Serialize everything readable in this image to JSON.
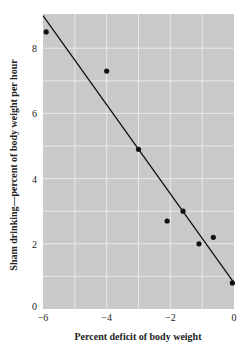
{
  "chart_data": {
    "type": "scatter",
    "title": "",
    "xlabel": "Percent deficit of body weight",
    "ylabel": "Sham drinking—percent of body weight per hour",
    "xlim": [
      -6,
      0
    ],
    "ylim": [
      0,
      9
    ],
    "x_ticks": [
      -6,
      -4,
      -2,
      0
    ],
    "x_tick_labels": [
      "−6",
      "−4",
      "−2",
      "0"
    ],
    "y_ticks": [
      0,
      2,
      4,
      6,
      8
    ],
    "y_tick_labels": [
      "0",
      "2",
      "4",
      "6",
      "8"
    ],
    "grid": true,
    "x_grid": [
      -5,
      -4,
      -3,
      -2,
      -1
    ],
    "y_grid": [
      1,
      2,
      3,
      4,
      5,
      6,
      7,
      8
    ],
    "series": [
      {
        "name": "observations",
        "type": "scatter",
        "x": [
          -5.9,
          -4.0,
          -3.0,
          -2.1,
          -1.6,
          -1.1,
          -0.65,
          -0.05
        ],
        "y": [
          8.5,
          7.3,
          4.9,
          2.7,
          3.0,
          2.0,
          2.2,
          0.8
        ]
      },
      {
        "name": "regression line",
        "type": "line",
        "x": [
          -6,
          0
        ],
        "y": [
          9.0,
          0.8
        ]
      }
    ],
    "colors": {
      "plot_bg": "#c9c9c9",
      "grid": "#e8e8e8",
      "points": "#111111",
      "line": "#111111"
    }
  }
}
